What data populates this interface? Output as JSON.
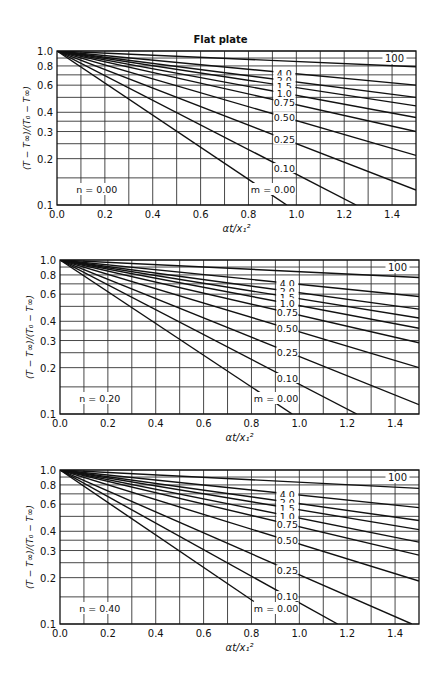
{
  "figure": {
    "title": "Flat plate"
  },
  "chart_data": [
    {
      "type": "line",
      "title": "Flat plate",
      "panel_label": "n = 0.00",
      "xlabel": "αt/x₁²",
      "ylabel": "(T − T∞)/(T₀ − T∞)",
      "xscale": "linear",
      "yscale": "log",
      "xlim": [
        0.0,
        1.5
      ],
      "ylim": [
        0.1,
        1.0
      ],
      "xticks": [
        "0.0",
        "0.2",
        "0.4",
        "0.6",
        "0.8",
        "1.0",
        "1.2",
        "1.4"
      ],
      "yticks": [
        "1.0",
        "0.8",
        "0.6",
        "0.4",
        "0.3",
        "0.2",
        "0.1"
      ],
      "grid": true,
      "curve_param": "m",
      "series": [
        {
          "name": "100",
          "x": [
            0.0,
            1.5
          ],
          "y": [
            1.0,
            0.79
          ]
        },
        {
          "name": "4.0",
          "x": [
            0.0,
            1.5
          ],
          "y": [
            1.0,
            0.6
          ]
        },
        {
          "name": "2.0",
          "x": [
            0.0,
            1.5
          ],
          "y": [
            1.0,
            0.5
          ]
        },
        {
          "name": "1.5",
          "x": [
            0.0,
            1.5
          ],
          "y": [
            1.0,
            0.44
          ]
        },
        {
          "name": "1.0",
          "x": [
            0.0,
            1.5
          ],
          "y": [
            1.0,
            0.37
          ]
        },
        {
          "name": "0.75",
          "x": [
            0.0,
            1.5
          ],
          "y": [
            1.0,
            0.3
          ]
        },
        {
          "name": "0.50",
          "x": [
            0.0,
            1.5
          ],
          "y": [
            1.0,
            0.21
          ]
        },
        {
          "name": "0.25",
          "x": [
            0.0,
            1.5
          ],
          "y": [
            1.0,
            0.125
          ]
        },
        {
          "name": "0.10",
          "x": [
            0.0,
            1.25
          ],
          "y": [
            1.0,
            0.1
          ]
        },
        {
          "name": "0.00",
          "x": [
            0.0,
            0.96
          ],
          "y": [
            1.0,
            0.1
          ]
        }
      ],
      "annotations": [
        "n = 0.00",
        "m = 0.00",
        "100"
      ]
    },
    {
      "type": "line",
      "panel_label": "n = 0.20",
      "xlabel": "αt/x₁²",
      "ylabel": "(T − T∞)/(T₀ − T∞)",
      "xscale": "linear",
      "yscale": "log",
      "xlim": [
        0.0,
        1.5
      ],
      "ylim": [
        0.1,
        1.0
      ],
      "xticks": [
        "0.0",
        "0.2",
        "0.4",
        "0.6",
        "0.8",
        "1.0",
        "1.2",
        "1.4"
      ],
      "yticks": [
        "1.0",
        "0.8",
        "0.6",
        "0.4",
        "0.3",
        "0.2",
        "0.1"
      ],
      "grid": true,
      "curve_param": "m",
      "series": [
        {
          "name": "100",
          "x": [
            0.0,
            1.5
          ],
          "y": [
            1.0,
            0.77
          ]
        },
        {
          "name": "4.0",
          "x": [
            0.0,
            1.5
          ],
          "y": [
            1.0,
            0.58
          ]
        },
        {
          "name": "2.0",
          "x": [
            0.0,
            1.5
          ],
          "y": [
            1.0,
            0.48
          ]
        },
        {
          "name": "1.5",
          "x": [
            0.0,
            1.5
          ],
          "y": [
            1.0,
            0.42
          ]
        },
        {
          "name": "1.0",
          "x": [
            0.0,
            1.5
          ],
          "y": [
            1.0,
            0.36
          ]
        },
        {
          "name": "0.75",
          "x": [
            0.0,
            1.5
          ],
          "y": [
            1.0,
            0.29
          ]
        },
        {
          "name": "0.50",
          "x": [
            0.0,
            1.5
          ],
          "y": [
            1.0,
            0.2
          ]
        },
        {
          "name": "0.25",
          "x": [
            0.0,
            1.5
          ],
          "y": [
            1.0,
            0.115
          ]
        },
        {
          "name": "0.10",
          "x": [
            0.0,
            1.24
          ],
          "y": [
            1.0,
            0.1
          ]
        },
        {
          "name": "0.00",
          "x": [
            0.0,
            0.97
          ],
          "y": [
            1.0,
            0.1
          ]
        }
      ],
      "annotations": [
        "n = 0.20",
        "m = 0.00",
        "100"
      ]
    },
    {
      "type": "line",
      "panel_label": "n = 0.40",
      "xlabel": "αt/x₁²",
      "ylabel": "(T − T∞)/(T₀ − T∞)",
      "xscale": "linear",
      "yscale": "log",
      "xlim": [
        0.0,
        1.5
      ],
      "ylim": [
        0.1,
        1.0
      ],
      "xticks": [
        "0.0",
        "0.2",
        "0.4",
        "0.6",
        "0.8",
        "1.0",
        "1.2",
        "1.4"
      ],
      "yticks": [
        "1.0",
        "0.8",
        "0.6",
        "0.4",
        "0.3",
        "0.2",
        "0.1"
      ],
      "grid": true,
      "curve_param": "m",
      "series": [
        {
          "name": "100",
          "x": [
            0.0,
            1.5
          ],
          "y": [
            1.0,
            0.76
          ]
        },
        {
          "name": "4.0",
          "x": [
            0.0,
            1.5
          ],
          "y": [
            1.0,
            0.57
          ]
        },
        {
          "name": "2.0",
          "x": [
            0.0,
            1.5
          ],
          "y": [
            1.0,
            0.47
          ]
        },
        {
          "name": "1.5",
          "x": [
            0.0,
            1.5
          ],
          "y": [
            1.0,
            0.41
          ]
        },
        {
          "name": "1.0",
          "x": [
            0.0,
            1.5
          ],
          "y": [
            1.0,
            0.34
          ]
        },
        {
          "name": "0.75",
          "x": [
            0.0,
            1.5
          ],
          "y": [
            1.0,
            0.28
          ]
        },
        {
          "name": "0.50",
          "x": [
            0.0,
            1.5
          ],
          "y": [
            1.0,
            0.19
          ]
        },
        {
          "name": "0.25",
          "x": [
            0.0,
            1.47
          ],
          "y": [
            1.0,
            0.1
          ]
        },
        {
          "name": "0.10",
          "x": [
            0.0,
            1.16
          ],
          "y": [
            1.0,
            0.1
          ]
        },
        {
          "name": "0.00",
          "x": [
            0.0,
            0.81
          ],
          "y": [
            1.0,
            0.14
          ]
        }
      ],
      "annotations": [
        "n = 0.40",
        "m = 0.00",
        "100"
      ]
    }
  ],
  "panels": [
    {
      "n_label": "n = 0.00",
      "m_label": "m = 0.00",
      "hundred_label": "100",
      "xlabel": "αt/x₁²",
      "ylabel": "(T − T∞)/(T₀ − T∞)"
    },
    {
      "n_label": "n = 0.20",
      "m_label": "m = 0.00",
      "hundred_label": "100",
      "xlabel": "αt/x₁²",
      "ylabel": "(T − T∞)/(T₀ − T∞)"
    },
    {
      "n_label": "n = 0.40",
      "m_label": "m = 0.00",
      "hundred_label": "100",
      "xlabel": "αt/x₁²",
      "ylabel": "(T − T∞)/(T₀ − T∞)"
    }
  ],
  "curve_labels": [
    "4.0",
    "2.0",
    "1.5",
    "1.0",
    "0.75",
    "0.50",
    "0.25",
    "0.10"
  ],
  "colors": {
    "line": "#111111",
    "grid": "#333333",
    "background": "#ffffff"
  }
}
